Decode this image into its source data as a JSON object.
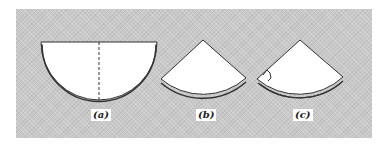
{
  "figure": {
    "labels": {
      "a": "(a)",
      "b": "(b)",
      "c": "(c)"
    },
    "colors": {
      "panel": "#c9c9c9",
      "shape_fill": "#ffffff",
      "outline": "#333333"
    }
  }
}
